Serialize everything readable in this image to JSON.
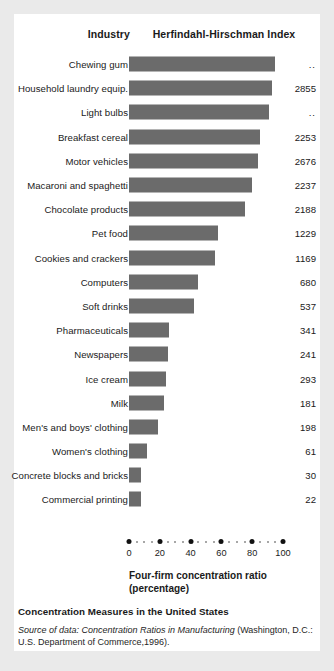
{
  "header": {
    "industry_label": "Industry",
    "index_label": "Herfindahl-Hirschman Index"
  },
  "axis": {
    "title_line1": "Four-firm concentration ratio",
    "title_line2": "(percentage)",
    "ticks": [
      "0",
      "20",
      "40",
      "60",
      "80",
      "100"
    ]
  },
  "caption": {
    "title": "Concentration Measures in the United States",
    "source_label": "Source of data:",
    "source_work": "Concentration Ratios in Manufacturing",
    "source_rest": "(Washington, D.C.: U.S. Department of Commerce,1996)."
  },
  "colors": {
    "bar": "#6b6b6b",
    "card": "#ffffff",
    "page": "#eaeaea",
    "text": "#1a1a1a"
  },
  "chart_data": {
    "type": "bar",
    "orientation": "horizontal",
    "title": "Concentration Measures in the United States",
    "xlabel": "Four-firm concentration ratio (percentage)",
    "ylabel": "Industry",
    "xlim": [
      0,
      100
    ],
    "grid": false,
    "legend": "none",
    "value_column_header": "Herfindahl-Hirschman Index",
    "categories": [
      "Chewing gum",
      "Household laundry equip.",
      "Light bulbs",
      "Breakfast cereal",
      "Motor vehicles",
      "Macaroni and spaghetti",
      "Chocolate products",
      "Pet food",
      "Cookies and crackers",
      "Computers",
      "Soft drinks",
      "Pharmaceuticals",
      "Newspapers",
      "Ice cream",
      "Milk",
      "Men's and boys' clothing",
      "Women's clothing",
      "Concrete blocks and bricks",
      "Commercial printing"
    ],
    "values": [
      95,
      93,
      91,
      85,
      84,
      80,
      75,
      58,
      56,
      45,
      42,
      26,
      25,
      24,
      23,
      19,
      12,
      8,
      8
    ],
    "hhi": [
      "..",
      "2855",
      "..",
      "2253",
      "2676",
      "2237",
      "2188",
      "1229",
      "1169",
      "680",
      "537",
      "341",
      "241",
      "293",
      "181",
      "198",
      "61",
      "30",
      "22"
    ],
    "rows": [
      {
        "label": "Chewing gum",
        "ratio": 95,
        "hhi": ".."
      },
      {
        "label": "Household laundry equip.",
        "ratio": 93,
        "hhi": "2855"
      },
      {
        "label": "Light bulbs",
        "ratio": 91,
        "hhi": ".."
      },
      {
        "label": "Breakfast cereal",
        "ratio": 85,
        "hhi": "2253"
      },
      {
        "label": "Motor vehicles",
        "ratio": 84,
        "hhi": "2676"
      },
      {
        "label": "Macaroni and spaghetti",
        "ratio": 80,
        "hhi": "2237"
      },
      {
        "label": "Chocolate products",
        "ratio": 75,
        "hhi": "2188"
      },
      {
        "label": "Pet food",
        "ratio": 58,
        "hhi": "1229"
      },
      {
        "label": "Cookies and crackers",
        "ratio": 56,
        "hhi": "1169"
      },
      {
        "label": "Computers",
        "ratio": 45,
        "hhi": "680"
      },
      {
        "label": "Soft drinks",
        "ratio": 42,
        "hhi": "537"
      },
      {
        "label": "Pharmaceuticals",
        "ratio": 26,
        "hhi": "341"
      },
      {
        "label": "Newspapers",
        "ratio": 25,
        "hhi": "241"
      },
      {
        "label": "Ice cream",
        "ratio": 24,
        "hhi": "293"
      },
      {
        "label": "Milk",
        "ratio": 23,
        "hhi": "181"
      },
      {
        "label": "Men's and boys' clothing",
        "ratio": 19,
        "hhi": "198"
      },
      {
        "label": "Women's clothing",
        "ratio": 12,
        "hhi": "61"
      },
      {
        "label": "Concrete blocks and bricks",
        "ratio": 8,
        "hhi": "30"
      },
      {
        "label": "Commercial printing",
        "ratio": 8,
        "hhi": "22"
      }
    ]
  }
}
